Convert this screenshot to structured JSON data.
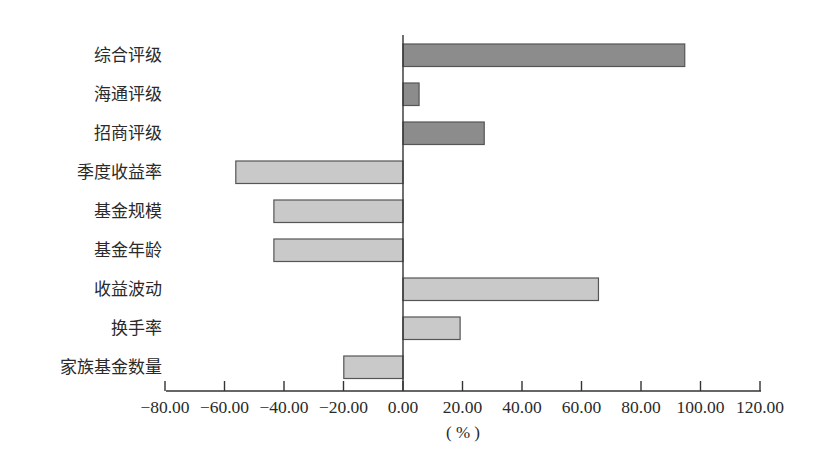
{
  "chart_data": {
    "type": "bar",
    "orientation": "horizontal",
    "title": "",
    "xlabel": "(%)",
    "ylabel": "",
    "xlim": [
      -80,
      120
    ],
    "x_ticks": [
      -80,
      -60,
      -40,
      -20,
      0,
      20,
      40,
      60,
      80,
      100,
      120
    ],
    "x_tick_labels": [
      "-80.00",
      "-60.00",
      "-40.00",
      "-20.00",
      "0.00",
      "20.00",
      "40.00",
      "60.00",
      "80.00",
      "100.00",
      "120.00"
    ],
    "grid": false,
    "legend": null,
    "categories": [
      "综合评级",
      "海通评级",
      "招商评级",
      "季度收益率",
      "基金规模",
      "基金年龄",
      "收益波动",
      "换手率",
      "家族基金数量"
    ],
    "values": [
      94.7,
      5.4,
      27.3,
      -56.2,
      -43.4,
      -43.4,
      65.7,
      19.2,
      -19.9
    ],
    "bar_groups": [
      "rating",
      "rating",
      "rating",
      "factor",
      "factor",
      "factor",
      "factor",
      "factor",
      "factor"
    ]
  },
  "colors": {
    "rating_bar": "#8c8c8c",
    "factor_bar": "#c9c9c9",
    "bar_border": "#555555",
    "axis": "#333333",
    "text": "#2a2a2a"
  },
  "axis": {
    "unit_label": "( % )"
  }
}
